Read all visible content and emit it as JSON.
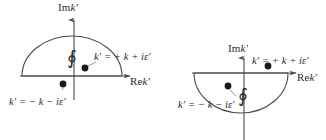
{
  "figure": {
    "background_color": "#ffffff",
    "stroke_color": "#4a4a4a",
    "text_color": "#2a2a2a",
    "pole_color": "#1a1a1a"
  },
  "panels": [
    {
      "id": "left-panel",
      "name": "upper-half-plane-contour",
      "contour": "upper semicircle closed in the upper half plane",
      "axes": {
        "imaginary_label": "Im",
        "imaginary_variable": "k′",
        "real_label": "Re",
        "real_variable": "k′"
      },
      "integral_symbol": "∮",
      "labels": {
        "pole_right": "k′ = + k + iε′",
        "pole_left": "k′ = − k − iε′"
      },
      "poles": [
        {
          "name": "pole-plus-k",
          "label": "k′ = + k + iε′",
          "x": 85,
          "y": 68
        },
        {
          "name": "pole-minus-k",
          "label": "k′ = − k − iε′",
          "x": 63,
          "y": 84
        }
      ]
    },
    {
      "id": "right-panel",
      "name": "lower-half-plane-contour",
      "contour": "lower semicircle closed in the lower half plane",
      "axes": {
        "imaginary_label": "Im",
        "imaginary_variable": "k′",
        "real_label": "Re",
        "real_variable": "k′"
      },
      "integral_symbol": "∮",
      "labels": {
        "pole_right": "k′ = + k + iε′",
        "pole_left": "k′ = − k − iε′"
      },
      "poles": [
        {
          "name": "pole-plus-k",
          "label": "k′ = + k + iε′",
          "x": 268,
          "y": 66
        },
        {
          "name": "pole-minus-k",
          "label": "k′ = − k − iε′",
          "x": 228,
          "y": 86
        }
      ]
    }
  ]
}
